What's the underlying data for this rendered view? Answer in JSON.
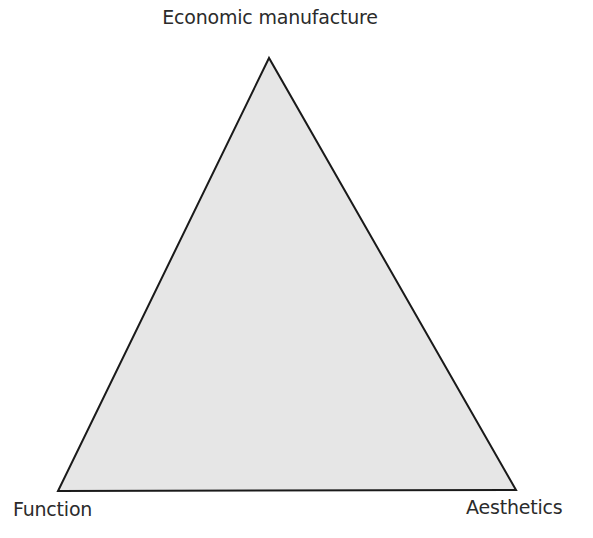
{
  "diagram": {
    "type": "triangle",
    "vertices": {
      "top": {
        "label": "Economic manufacture",
        "x": 269,
        "y": 58
      },
      "bottom_left": {
        "label": "Function",
        "x": 58,
        "y": 491
      },
      "bottom_right": {
        "label": "Aesthetics",
        "x": 516,
        "y": 490
      }
    },
    "colors": {
      "fill": "#e6e6e6",
      "stroke": "#1a1a1a",
      "text": "#2b2b2b"
    }
  }
}
